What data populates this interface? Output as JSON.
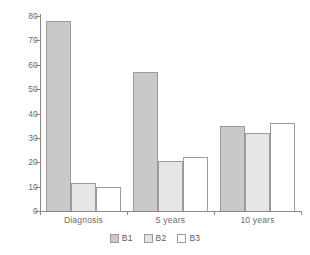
{
  "chart_data": {
    "type": "bar",
    "title": "",
    "subtitle": "",
    "xlabel": "",
    "ylabel": "",
    "categories": [
      "Diagnosis",
      "5 years",
      "10 years"
    ],
    "series": [
      {
        "name": "B1",
        "values": [
          78,
          57,
          35
        ],
        "color": "#c9c9c9"
      },
      {
        "name": "B2",
        "values": [
          11.5,
          20.5,
          32
        ],
        "color": "#e6e6e6"
      },
      {
        "name": "B3",
        "values": [
          10,
          22,
          36
        ],
        "color": "#ffffff"
      }
    ],
    "ylim": [
      0,
      80
    ],
    "yticks": [
      0,
      10,
      20,
      30,
      40,
      50,
      60,
      70,
      80
    ],
    "ytick_labels": [
      "0",
      "10",
      "20",
      "30",
      "40",
      "50",
      "60",
      "70",
      "80"
    ],
    "grid": false,
    "legend_position": "bottom",
    "legend_entries": [
      "B1",
      "B2",
      "B3"
    ],
    "axis_color": "#8a8a8a",
    "bar_border_color": "#9b9b9b",
    "text_color": "#6d6d6d",
    "background": "#ffffff"
  }
}
